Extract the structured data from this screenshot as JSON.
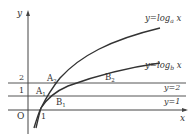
{
  "diagram": {
    "axes": {
      "x_label": "x",
      "y_label": "y",
      "origin_label": "O",
      "x_tick_label": "1"
    },
    "y_ticks": [
      {
        "value": 1,
        "label": "1"
      },
      {
        "value": 2,
        "label": "2"
      }
    ],
    "curves": [
      {
        "name": "log-a",
        "prefix": "y=log",
        "base": "a",
        "var": " x"
      },
      {
        "name": "log-b",
        "prefix": "y=log",
        "base": "b",
        "var": " x"
      }
    ],
    "horizontal_lines": [
      {
        "label": "y=2"
      },
      {
        "label": "y=1"
      }
    ],
    "points": {
      "A1": {
        "main": "A",
        "sub": "1"
      },
      "A2": {
        "main": "A",
        "sub": "2"
      },
      "B1": {
        "main": "B",
        "sub": "1"
      },
      "B2": {
        "main": "B",
        "sub": "2"
      }
    },
    "colors": {
      "line": "#333333",
      "grid": "#555555",
      "background": "#ffffff"
    }
  }
}
